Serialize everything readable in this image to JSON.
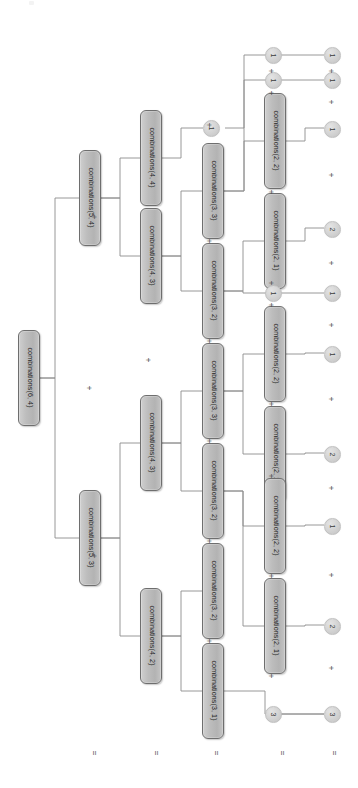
{
  "diagram": {
    "orientation": "rotated-90-clockwise",
    "operator_symbol": "+",
    "equals_symbol": "=",
    "colors": {
      "node_fill": "#bdbdbd",
      "node_border": "#6e6e6e",
      "circle_fill": "#d2d2d2",
      "wire": "#8d8d8d",
      "background": "#ffffff",
      "text": "#1e1e1e"
    },
    "columns": [
      {
        "index": 0,
        "x": 27,
        "equals_x": 90
      },
      {
        "index": 1,
        "x": 88,
        "equals_x": 152
      },
      {
        "index": 2,
        "x": 148,
        "equals_x": 212
      },
      {
        "index": 3,
        "x": 210,
        "equals_x": 278
      },
      {
        "index": 4,
        "x": 272,
        "equals_x": 330
      },
      {
        "index": 5,
        "x": 331,
        "equals_x": 330
      }
    ],
    "nodes": [
      {
        "id": "n0",
        "label": "combinations(6, 4)",
        "type": "box",
        "col": 0,
        "x": 18,
        "y": 330,
        "w": 22,
        "h": 96
      },
      {
        "id": "n1",
        "label": "combinations(5, 4)",
        "type": "box",
        "col": 1,
        "x": 79,
        "y": 150,
        "w": 22,
        "h": 96
      },
      {
        "id": "n2",
        "label": "combinations(5, 3)",
        "type": "box",
        "col": 1,
        "x": 79,
        "y": 490,
        "w": 22,
        "h": 96
      },
      {
        "id": "n3",
        "label": "combinations(4, 4)",
        "type": "box",
        "col": 2,
        "x": 140,
        "y": 110,
        "w": 22,
        "h": 96
      },
      {
        "id": "n4",
        "label": "combinations(4, 3)",
        "type": "box",
        "col": 2,
        "x": 140,
        "y": 208,
        "w": 22,
        "h": 96
      },
      {
        "id": "n5",
        "label": "combinations(4, 3)",
        "type": "box",
        "col": 2,
        "x": 140,
        "y": 395,
        "w": 22,
        "h": 96
      },
      {
        "id": "n6",
        "label": "combinations(4, 2)",
        "type": "box",
        "col": 2,
        "x": 140,
        "y": 588,
        "w": 22,
        "h": 96
      },
      {
        "id": "c1",
        "label": "1",
        "type": "circle",
        "col": 3,
        "x": 203,
        "y": 120
      },
      {
        "id": "n7",
        "label": "combinations(3, 3)",
        "type": "box",
        "col": 3,
        "x": 202,
        "y": 143,
        "w": 22,
        "h": 96
      },
      {
        "id": "n8",
        "label": "combinations(3, 2)",
        "type": "box",
        "col": 3,
        "x": 202,
        "y": 243,
        "w": 22,
        "h": 96
      },
      {
        "id": "n9",
        "label": "combinations(3, 3)",
        "type": "box",
        "col": 3,
        "x": 202,
        "y": 343,
        "w": 22,
        "h": 96
      },
      {
        "id": "n10",
        "label": "combinations(3, 2)",
        "type": "box",
        "col": 3,
        "x": 202,
        "y": 443,
        "w": 22,
        "h": 96
      },
      {
        "id": "n11",
        "label": "combinations(3, 2)",
        "type": "box",
        "col": 3,
        "x": 202,
        "y": 543,
        "w": 22,
        "h": 96
      },
      {
        "id": "n12",
        "label": "combinations(3, 1)",
        "type": "box",
        "col": 3,
        "x": 202,
        "y": 643,
        "w": 22,
        "h": 96
      },
      {
        "id": "c2",
        "label": "1",
        "type": "circle",
        "col": 4,
        "x": 265,
        "y": 47
      },
      {
        "id": "c3",
        "label": "1",
        "type": "circle",
        "col": 4,
        "x": 265,
        "y": 72
      },
      {
        "id": "n13",
        "label": "combinations(2, 2)",
        "type": "box",
        "col": 4,
        "x": 264,
        "y": 93,
        "w": 22,
        "h": 96
      },
      {
        "id": "n14",
        "label": "combinations(2, 1)",
        "type": "box",
        "col": 4,
        "x": 264,
        "y": 193,
        "w": 22,
        "h": 96
      },
      {
        "id": "c4",
        "label": "1",
        "type": "circle",
        "col": 4,
        "x": 265,
        "y": 285
      },
      {
        "id": "n15",
        "label": "combinations(2, 2)",
        "type": "box",
        "col": 4,
        "x": 264,
        "y": 306,
        "w": 22,
        "h": 96
      },
      {
        "id": "n16",
        "label": "combinations(2, 1)",
        "type": "box",
        "col": 4,
        "x": 264,
        "y": 406,
        "w": 22,
        "h": 96
      },
      {
        "id": "n17",
        "label": "combinations(2, 2)",
        "type": "box",
        "col": 4,
        "x": 264,
        "y": 478,
        "w": 22,
        "h": 96
      },
      {
        "id": "n18",
        "label": "combinations(2, 1)",
        "type": "box",
        "col": 4,
        "x": 264,
        "y": 578,
        "w": 22,
        "h": 96
      },
      {
        "id": "c5",
        "label": "3",
        "type": "circle",
        "col": 4,
        "x": 265,
        "y": 706
      },
      {
        "id": "r1",
        "label": "1",
        "type": "circle",
        "col": 5,
        "x": 324,
        "y": 47
      },
      {
        "id": "r2",
        "label": "1",
        "type": "circle",
        "col": 5,
        "x": 324,
        "y": 72
      },
      {
        "id": "r3",
        "label": "1",
        "type": "circle",
        "col": 5,
        "x": 324,
        "y": 121
      },
      {
        "id": "r4",
        "label": "2",
        "type": "circle",
        "col": 5,
        "x": 324,
        "y": 221
      },
      {
        "id": "r5",
        "label": "1",
        "type": "circle",
        "col": 5,
        "x": 324,
        "y": 285
      },
      {
        "id": "r6",
        "label": "1",
        "type": "circle",
        "col": 5,
        "x": 324,
        "y": 346
      },
      {
        "id": "r7",
        "label": "2",
        "type": "circle",
        "col": 5,
        "x": 324,
        "y": 446
      },
      {
        "id": "r8",
        "label": "1",
        "type": "circle",
        "col": 5,
        "x": 324,
        "y": 518
      },
      {
        "id": "r9",
        "label": "2",
        "type": "circle",
        "col": 5,
        "x": 324,
        "y": 618
      },
      {
        "id": "r10",
        "label": "3",
        "type": "circle",
        "col": 5,
        "x": 324,
        "y": 706
      }
    ],
    "plus_operators": [
      {
        "x": 143,
        "y": 355
      },
      {
        "x": 84,
        "y": 383
      },
      {
        "x": 89,
        "y": 212
      },
      {
        "x": 89,
        "y": 551
      },
      {
        "x": 204,
        "y": 120
      },
      {
        "x": 204,
        "y": 236
      },
      {
        "x": 204,
        "y": 336
      },
      {
        "x": 204,
        "y": 436
      },
      {
        "x": 204,
        "y": 536
      },
      {
        "x": 204,
        "y": 636
      },
      {
        "x": 266,
        "y": 66
      },
      {
        "x": 266,
        "y": 88
      },
      {
        "x": 266,
        "y": 187
      },
      {
        "x": 266,
        "y": 278
      },
      {
        "x": 266,
        "y": 300
      },
      {
        "x": 266,
        "y": 399
      },
      {
        "x": 266,
        "y": 471
      },
      {
        "x": 266,
        "y": 571
      },
      {
        "x": 266,
        "y": 671
      },
      {
        "x": 326,
        "y": 66
      },
      {
        "x": 326,
        "y": 97
      },
      {
        "x": 326,
        "y": 170
      },
      {
        "x": 326,
        "y": 258
      },
      {
        "x": 326,
        "y": 320
      },
      {
        "x": 326,
        "y": 394
      },
      {
        "x": 326,
        "y": 483
      },
      {
        "x": 326,
        "y": 570
      },
      {
        "x": 326,
        "y": 663
      }
    ],
    "equals_row": [
      {
        "x": 90,
        "y": 748
      },
      {
        "x": 152,
        "y": 748
      },
      {
        "x": 212,
        "y": 748
      },
      {
        "x": 278,
        "y": 748
      },
      {
        "x": 330,
        "y": 748
      }
    ],
    "wires": [
      "M40,378 H55 V198 H79",
      "M40,378 H55 V538 H79",
      "M101,198 H120 V158 H140",
      "M101,198 H120 V256 H140",
      "M101,538 H120 V443 H140",
      "M101,538 H120 V636 H140",
      "M162,158 H181 V128 H203",
      "M162,256 H181 V191 H202",
      "M162,256 H181 V291 H202",
      "M162,443 H181 V391 H202",
      "M162,443 H181 V491 H202",
      "M162,636 H181 V591 H202",
      "M162,636 H181 V691 H202",
      "M225,128 H244 V55 H324",
      "M224,191 H244 V80 H324",
      "M224,191 H244 V141 H264",
      "M224,291 H243 V241 H264",
      "M224,291 H243 V293 H324",
      "M224,391 H243 V354 H264",
      "M224,391 H243 V454 H264",
      "M224,491 H243 V526 H264",
      "M224,491 H243 V626 H264",
      "M224,691 H265 V714 H324",
      "M286,141 H305 V128 H324",
      "M286,241 H305 V228 H324",
      "M286,354 H305 V353 H324",
      "M286,454 H305 V453 H324",
      "M286,526 H305 V525 H324",
      "M286,626 H305 V625 H324",
      "M280,714 H324"
    ]
  }
}
